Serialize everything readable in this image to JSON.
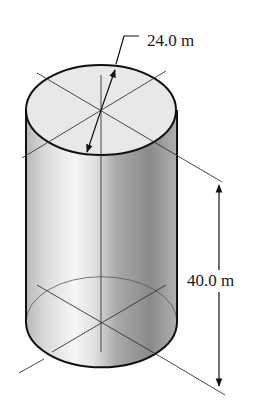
{
  "figure": {
    "shape": "cylinder",
    "dimensions": {
      "diameter": {
        "label": "24.0 m",
        "value": 24.0,
        "unit": "m"
      },
      "height": {
        "label": "40.0 m",
        "value": 40.0,
        "unit": "m"
      }
    },
    "colors": {
      "outline": "#111111",
      "top_face": "#e6e6e6",
      "side_light": "#f2f2f2",
      "side_dark": "#8c8c8c",
      "guide_lines": "#333333"
    }
  }
}
